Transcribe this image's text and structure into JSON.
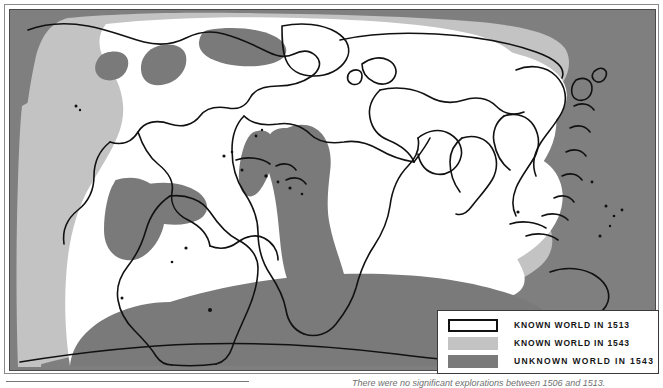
{
  "figure": {
    "name": "world-exploration-map",
    "background_ocean_color": "#7f7f7f",
    "known_1513_color": "#ffffff",
    "known_1543_color": "#c3c3c3",
    "unknown_1543_color": "#7a7a7a",
    "coastline_color": "#111111"
  },
  "legend": {
    "title": "",
    "items": [
      {
        "label": "KNOWN WORLD IN 1513",
        "swatch": "white-with-black-border",
        "color": "#ffffff"
      },
      {
        "label": "KNOWN WORLD IN 1543",
        "swatch": "light-gray",
        "color": "#c3c3c3"
      },
      {
        "label": "UNKNOWN WORLD IN 1543",
        "swatch": "dark-gray",
        "color": "#7a7a7a"
      }
    ]
  },
  "caption": {
    "text": "There were no significant explorations between 1506 and 1513."
  }
}
